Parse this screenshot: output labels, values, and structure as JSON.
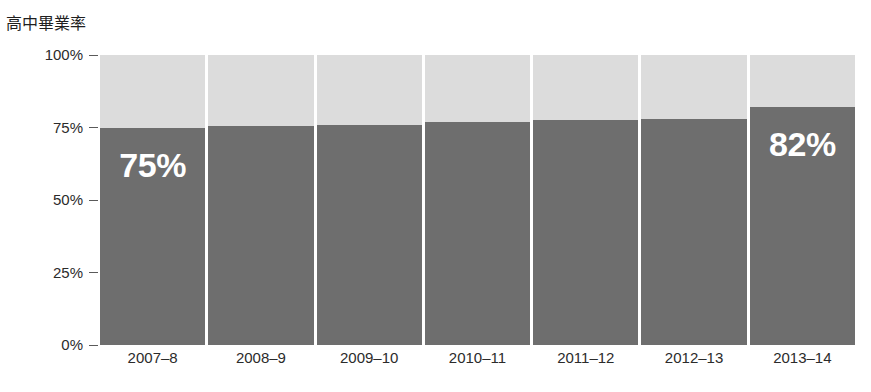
{
  "axis_title": "高中畢業率",
  "crop_remnant": "· · · · · · · · · ·",
  "chart_data": {
    "type": "bar",
    "title": "高中畢業率",
    "subtype": "stacked-100-percent",
    "categories": [
      "2007–8",
      "2008–9",
      "2009–10",
      "2010–11",
      "2011–12",
      "2012–13",
      "2013–14"
    ],
    "values": [
      75,
      75.5,
      76,
      77,
      77.5,
      78,
      82
    ],
    "series": [
      {
        "name": "graduated",
        "color": "#6e6e6e",
        "values": [
          75,
          75.5,
          76,
          77,
          77.5,
          78,
          82
        ]
      },
      {
        "name": "remainder",
        "color": "#dcdcdc",
        "values": [
          25,
          24.5,
          24,
          23,
          22.5,
          22,
          18
        ]
      }
    ],
    "point_labels": [
      {
        "index": 0,
        "text": "75%"
      },
      {
        "index": 6,
        "text": "82%"
      }
    ],
    "xlabel": "",
    "ylabel": "高中畢業率",
    "ylim": [
      0,
      100
    ],
    "yticks": [
      0,
      25,
      50,
      75,
      100
    ],
    "ytick_labels": [
      "0%",
      "25%",
      "50%",
      "75%",
      "100%"
    ],
    "grid": false,
    "legend": "none",
    "bar_color": "#6e6e6e",
    "background_color": "#dcdcdc",
    "label_color": "#ffffff"
  }
}
